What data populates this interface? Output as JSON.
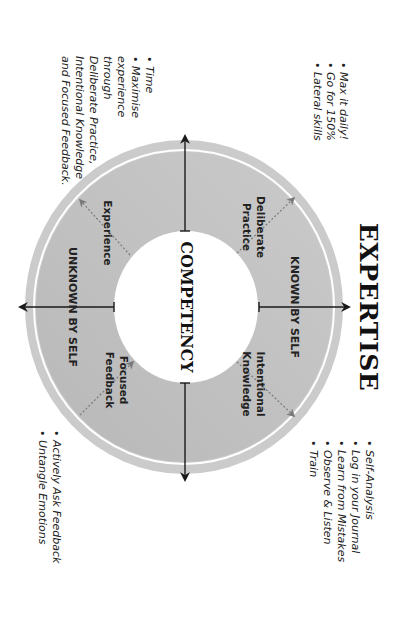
{
  "diagram": {
    "orientation": "rotated 90deg clockwise",
    "title": "EXPERTISE",
    "center": "COMPETENCY",
    "axes": {
      "known": "KNOWN BY SELF",
      "unknown": "UNKNOWN BY SELF"
    },
    "quadrants": [
      {
        "id": "deliberate",
        "line1": "Deliberate",
        "line2": "Practice"
      },
      {
        "id": "intentional",
        "line1": "Intentional",
        "line2": "Knowledge"
      },
      {
        "id": "experience",
        "line1": "Experience",
        "line2": ""
      },
      {
        "id": "focused",
        "line1": "Focused",
        "line2": "Feedback"
      }
    ],
    "notes": {
      "deliberate": [
        "• Max it daily!",
        "• Go for 150%",
        "• Lateral skills"
      ],
      "intentional": [
        "• Self-Analysis",
        "• Log in your Journal",
        "• Learn from Mistakes",
        "• Observe & Listen",
        "• Train"
      ],
      "experience": [
        "• Time",
        "• Maximise",
        "  experience",
        "  through",
        "  Deliberate Practice,",
        "  Intentional Knowledge",
        "  and Focused Feedback."
      ],
      "focused": [
        "• Actively Ask Feedback",
        "• Untangle Emotions"
      ]
    },
    "colors": {
      "outer_band": "#cbcbcb",
      "ring_fill": "#bcbcbc",
      "ring_fill_light": "#c6c6c6",
      "separator": "#ffffff",
      "axis": "#1a1a1a",
      "dashed_arrow": "#7a7a7a"
    }
  }
}
